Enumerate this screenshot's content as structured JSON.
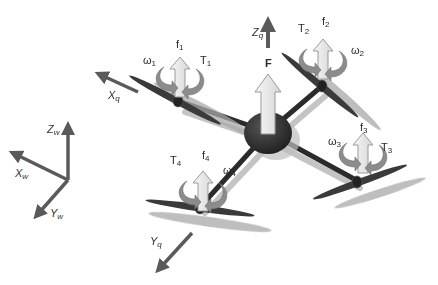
{
  "diagram": {
    "colors": {
      "background": "#ffffff",
      "arm": "#2b2b2b",
      "arm_shadow": "#bdbdbd",
      "body": "#2e2e2e",
      "propeller": "#3a3a3a",
      "propeller_shadow": "#a8a8a8",
      "force_arrow_fill": "#ececec",
      "force_arrow_stroke": "#9a9a9a",
      "torque_arrow": "#8c8c8c",
      "axis_arrow": "#5a5a5a"
    },
    "world_frame": {
      "x": {
        "base": "X",
        "sub": "w"
      },
      "y": {
        "base": "Y",
        "sub": "w"
      },
      "z": {
        "base": "Z",
        "sub": "w"
      }
    },
    "quad_frame": {
      "x": {
        "base": "X",
        "sub": "q"
      },
      "y": {
        "base": "Y",
        "sub": "q"
      },
      "z": {
        "base": "Z",
        "sub": "q"
      }
    },
    "total_force": {
      "label": "F"
    },
    "rotors": [
      {
        "id": 1,
        "force": {
          "base": "f",
          "sub": "1"
        },
        "torque": {
          "base": "T",
          "sub": "1"
        },
        "omega": {
          "base": "ω",
          "sub": "1"
        }
      },
      {
        "id": 2,
        "force": {
          "base": "f",
          "sub": "2"
        },
        "torque": {
          "base": "T",
          "sub": "2"
        },
        "omega": {
          "base": "ω",
          "sub": "2"
        }
      },
      {
        "id": 3,
        "force": {
          "base": "f",
          "sub": "3"
        },
        "torque": {
          "base": "T",
          "sub": "3"
        },
        "omega": {
          "base": "ω",
          "sub": "3"
        }
      },
      {
        "id": 4,
        "force": {
          "base": "f",
          "sub": "4"
        },
        "torque": {
          "base": "T",
          "sub": "4"
        },
        "omega": {
          "base": "ω",
          "sub": "4"
        }
      }
    ]
  }
}
